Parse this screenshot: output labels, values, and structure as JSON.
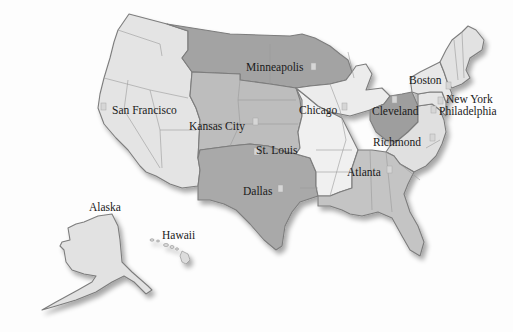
{
  "map": {
    "title": "Federal Reserve Districts",
    "colors": {
      "background": "#fdfdfd",
      "light": "#e4e4e4",
      "lighter": "#efefef",
      "medium": "#bdbdbd",
      "dark": "#a3a3a3",
      "border": "#7d7d7d"
    },
    "districts": [
      {
        "id": 1,
        "label": "Boston"
      },
      {
        "id": 2,
        "label": "New York"
      },
      {
        "id": 3,
        "label": "Philadelphia"
      },
      {
        "id": 4,
        "label": "Cleveland"
      },
      {
        "id": 5,
        "label": "Richmond"
      },
      {
        "id": 6,
        "label": "Atlanta"
      },
      {
        "id": 7,
        "label": "Chicago"
      },
      {
        "id": 8,
        "label": "St. Louis"
      },
      {
        "id": 9,
        "label": "Minneapolis"
      },
      {
        "id": 10,
        "label": "Kansas City"
      },
      {
        "id": 11,
        "label": "Dallas"
      },
      {
        "id": 12,
        "label": "San Francisco"
      }
    ],
    "other_labels": {
      "alaska": "Alaska",
      "hawaii": "Hawaii"
    }
  }
}
